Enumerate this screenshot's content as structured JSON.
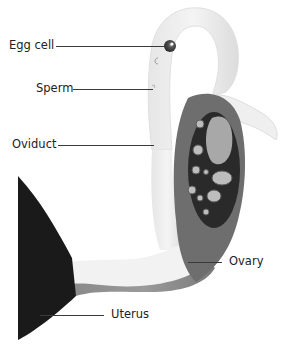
{
  "diagram": {
    "labels": [
      {
        "id": "egg-cell",
        "text": "Egg cell"
      },
      {
        "id": "sperm",
        "text": "Sperm"
      },
      {
        "id": "oviduct",
        "text": "Oviduct"
      },
      {
        "id": "ovary",
        "text": "Ovary"
      },
      {
        "id": "uterus",
        "text": "Uterus"
      }
    ],
    "colors": {
      "oviduct_light": "#ececec",
      "oviduct_shadow": "#d4d4d4",
      "ovary_outer": "#6e6e6e",
      "ovary_inner": "#2a2a2a",
      "follicle": "#bdbdbd",
      "uterus": "#1a1a1a",
      "egg": "#3a3a3a",
      "leader_line": "#3a3a3a"
    }
  }
}
